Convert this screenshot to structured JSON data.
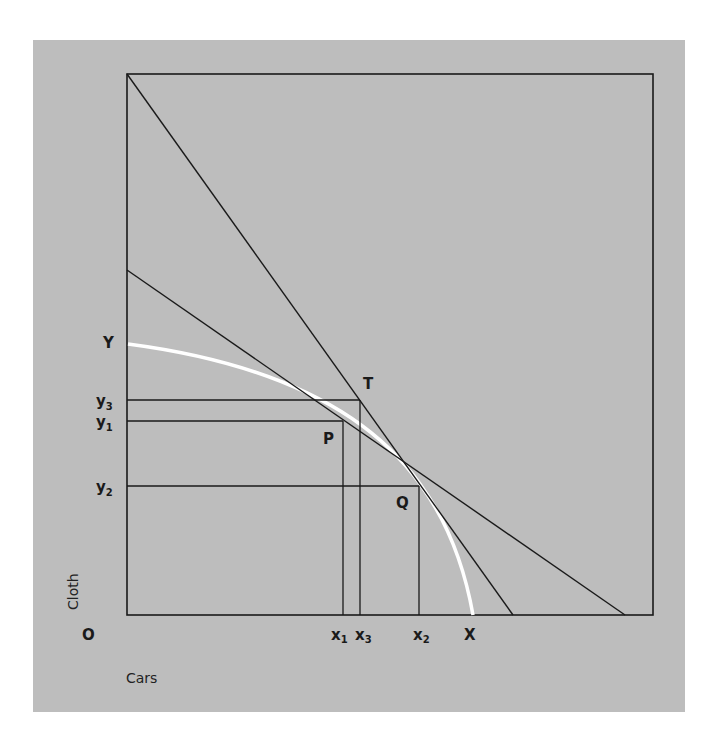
{
  "diagram": {
    "axes": {
      "x_label": "Cars",
      "y_label": "Cloth",
      "origin_label": "O"
    },
    "curve": {
      "name": "production possibility frontier",
      "y_intercept_label": "Y",
      "x_intercept_label": "X",
      "color": "#ffffff"
    },
    "points": [
      {
        "label": "P",
        "x_label": "x",
        "x_sub": "1",
        "y_label": "y",
        "y_sub": "1"
      },
      {
        "label": "Q",
        "x_label": "x",
        "x_sub": "2",
        "y_label": "y",
        "y_sub": "2"
      },
      {
        "label": "T",
        "x_label": "x",
        "x_sub": "3",
        "y_label": "y",
        "y_sub": "3"
      }
    ],
    "y_ticks": [
      {
        "base": "y",
        "sub": "3"
      },
      {
        "base": "y",
        "sub": "1"
      },
      {
        "base": "y",
        "sub": "2"
      }
    ],
    "x_ticks": [
      {
        "base": "x",
        "sub": "1"
      },
      {
        "base": "x",
        "sub": "3"
      },
      {
        "base": "x",
        "sub": "2"
      }
    ],
    "colors": {
      "background": "#bdbdbd",
      "lines": "#1a1a1a",
      "curve": "#ffffff"
    }
  }
}
